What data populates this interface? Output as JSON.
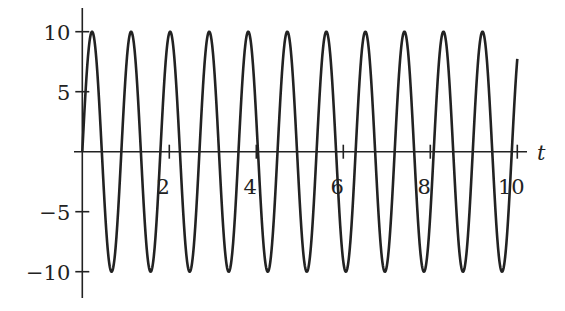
{
  "chart_data": {
    "type": "line",
    "title": "",
    "xlabel": "t",
    "ylabel": "",
    "function": "10*sin(7*t)",
    "xlim": [
      0,
      10
    ],
    "ylim": [
      -10,
      10
    ],
    "x_ticks": [
      2,
      4,
      6,
      8,
      10
    ],
    "x_tick_labels": [
      "2",
      "4",
      "6",
      "8",
      "10"
    ],
    "y_ticks": [
      10,
      5,
      -5,
      -10
    ],
    "y_tick_labels": [
      "10",
      "5",
      "−5",
      "−10"
    ],
    "grid": false,
    "legend": null,
    "series": [
      {
        "name": "y(t)",
        "amplitude": 10,
        "angular_frequency": 7,
        "period": 0.898,
        "color": "#222222",
        "x": [
          0,
          0.224,
          0.449,
          0.673,
          0.898,
          1.122,
          1.346,
          1.571,
          1.795,
          2.02,
          10
        ],
        "values": [
          0,
          10,
          0,
          -10,
          0,
          10,
          0,
          -10,
          0,
          10,
          7.74
        ]
      }
    ]
  },
  "axes": {
    "x_label": "t"
  }
}
